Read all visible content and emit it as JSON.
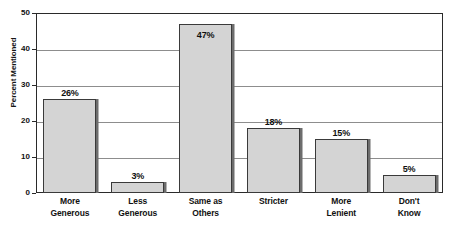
{
  "chart_data": {
    "type": "bar",
    "title": "",
    "xlabel": "",
    "ylabel": "Percent Mentioned",
    "ylim": [
      0,
      50
    ],
    "ytick_values": [
      50,
      40,
      30,
      20,
      10,
      0
    ],
    "ytick_labels": [
      "50",
      "40",
      "30",
      "20",
      "10",
      "0"
    ],
    "grid": true,
    "legend": false,
    "categories": [
      "More Generous",
      "Less Generous",
      "Same as Others",
      "Stricter",
      "More Lenient",
      "Don't Know"
    ],
    "category_lines": [
      [
        "More",
        "Generous"
      ],
      [
        "Less",
        "Generous"
      ],
      [
        "Same as",
        "Others"
      ],
      [
        "Stricter",
        ""
      ],
      [
        "More",
        "Lenient"
      ],
      [
        "Don't",
        "Know"
      ]
    ],
    "values": [
      26,
      3,
      47,
      18,
      15,
      5
    ],
    "data_labels": [
      "26%",
      "3%",
      "47%",
      "18%",
      "15%",
      "5%"
    ],
    "label_placement": [
      "above",
      "above",
      "inside",
      "above",
      "above",
      "above"
    ],
    "colors": {
      "bar_fill": "#d4d4d4",
      "bar_border": "#3a3a3a",
      "bar_shadow": "#6d6d6d",
      "gridline": "#8d8d8d",
      "axis": "#2a2a2a",
      "text": "#111111",
      "background": "#ffffff"
    }
  }
}
